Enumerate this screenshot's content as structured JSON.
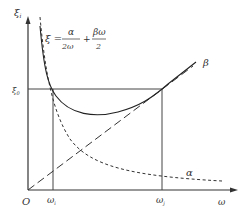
{
  "diagram": {
    "type": "rayleigh-damping-curve",
    "y_axis_label": "ξ",
    "y_axis_sub": "i",
    "x_axis_label": "ω",
    "origin_label": "O",
    "xi0_label": "ξ",
    "xi0_sub": "0",
    "omega1_label": "ω",
    "omega1_sub": "i",
    "omega2_label": "ω",
    "omega2_sub": "j",
    "formula": {
      "lhs": "ξ =",
      "term1_num": "α",
      "term1_den": "2ω",
      "plus": "+",
      "term2_num": "βω",
      "term2_den": "2"
    },
    "beta_label": "β",
    "alpha_label": "α"
  }
}
